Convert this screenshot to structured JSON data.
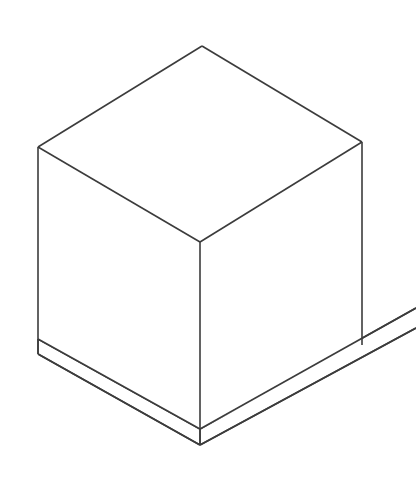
{
  "figure": {
    "kind": "technical-line-drawing",
    "projection": "isometric",
    "canvas": {
      "width": 416,
      "height": 495
    },
    "background_color": "#ffffff",
    "line_color": "#3c3c3c",
    "line_width": 1.6,
    "fill_color": "#ffffff",
    "object_count": 2,
    "objects": [
      {
        "name": "cube",
        "description": "Hexagonal silhouette cube shown in isometric view with three visible faces: top, left and right."
      },
      {
        "name": "slab",
        "description": "Thin flat plinth under the cube, extending off the right edge of the frame."
      }
    ],
    "vertices": {
      "cube_top_apex": {
        "x": 202,
        "y": 46
      },
      "cube_top_left": {
        "x": 38,
        "y": 147
      },
      "cube_top_right": {
        "x": 362,
        "y": 142
      },
      "cube_top_front": {
        "x": 200,
        "y": 242
      },
      "cube_bottom_left": {
        "x": 38,
        "y": 339
      },
      "cube_bottom_right": {
        "x": 362,
        "y": 345
      },
      "cube_bottom_front": {
        "x": 200,
        "y": 429
      },
      "slab_bottom_left": {
        "x": 38,
        "y": 354
      },
      "slab_bottom_front": {
        "x": 200,
        "y": 445
      },
      "slab_right_top_edge": {
        "x": 416,
        "y": 308
      },
      "slab_right_low_edge": {
        "x": 416,
        "y": 328
      }
    },
    "paths": {
      "top_face": "M 202 46 L 362 142 L 200 242 L 38 147 Z",
      "left_face": "M 38 147 L 200 242 L 200 429 L 38 339 Z",
      "right_face": "M 200 242 L 362 142 L 362 345 L 200 429 Z",
      "slab_front_left": "M 38 339 L 38 354 L 200 445 L 200 429 Z",
      "slab_front_right": "M 200 429 L 200 445 L 416 328 L 416 308 Z",
      "edge_top_left_rise": "M 38 147 L 202 46",
      "edge_top_right_rise": "M 202 46 L 362 142",
      "edge_top_left_fall": "M 38 147 L 200 242",
      "edge_top_right_fall": "M 362 142 L 200 242",
      "edge_vert_left": "M 38 147 L 38 339",
      "edge_vert_center": "M 200 242 L 200 429",
      "edge_vert_right": "M 362 142 L 362 345",
      "edge_slab_top_left": "M 38 339 L 200 429",
      "edge_slab_top_right": "M 200 429 L 416 308",
      "edge_slab_low_left": "M 38 354 L 200 445",
      "edge_slab_low_right": "M 200 445 L 416 328",
      "edge_slab_left_riser": "M 38 339 L 38 354",
      "edge_slab_ctr_riser": "M 200 429 L 200 445"
    }
  }
}
